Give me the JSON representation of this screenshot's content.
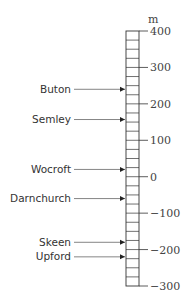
{
  "diagram": {
    "type": "height-scale",
    "unit": "m",
    "scale": {
      "min": -300,
      "max": 400,
      "major_step": 100,
      "minor_step": 25
    },
    "ticks": [
      {
        "value": 400,
        "label": "400"
      },
      {
        "value": 300,
        "label": "300"
      },
      {
        "value": 200,
        "label": "200"
      },
      {
        "value": 100,
        "label": "100"
      },
      {
        "value": 0,
        "label": "0"
      },
      {
        "value": -100,
        "label": "−100"
      },
      {
        "value": -200,
        "label": "−200"
      },
      {
        "value": -300,
        "label": "−300"
      }
    ],
    "places": [
      {
        "name": "Buton",
        "value": 240
      },
      {
        "name": "Semley",
        "value": 157
      },
      {
        "name": "Wocroft",
        "value": 20
      },
      {
        "name": "Darnchurch",
        "value": -60
      },
      {
        "name": "Skeen",
        "value": -180
      },
      {
        "name": "Upford",
        "value": -220
      }
    ]
  },
  "colors": {
    "line": "#333333",
    "text": "#333333",
    "background": "#ffffff"
  }
}
